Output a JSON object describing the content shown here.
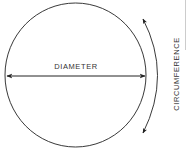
{
  "diagram": {
    "labels": {
      "diameter": "DIAMETER",
      "circumference": "CIRCUMFERENCE"
    },
    "colors": {
      "stroke": "#222222",
      "text": "#333333",
      "background": "#ffffff"
    }
  }
}
